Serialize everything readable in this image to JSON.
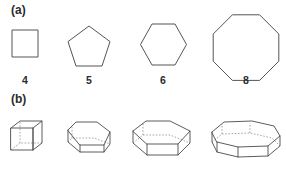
{
  "figure": {
    "background_color": "#ffffff",
    "stroke_color": "#555555",
    "hidden_stroke_color": "#8a8a8a",
    "text_color": "#2b2b2b",
    "panels": [
      {
        "id": "a",
        "label": "(a)",
        "caption_role": "regular-polygons-row"
      },
      {
        "id": "b",
        "label": "(b)",
        "caption_role": "prisms-row"
      }
    ]
  },
  "panel_a": {
    "label": "(a)",
    "shapes": [
      {
        "name": "square",
        "sides": 4,
        "side_count_label": "4",
        "label_x": 25,
        "points": "12,30 38,30 38,57 12,57"
      },
      {
        "name": "pentagon",
        "sides": 5,
        "side_count_label": "5",
        "label_x": 89,
        "points": "89,26 110,41.6 102,66 76,66 68,41.6"
      },
      {
        "name": "hexagon",
        "sides": 6,
        "side_count_label": "6",
        "label_x": 163,
        "points": "152,24 175,24 186.5,44.5 175,65 152,65 140.5,44.5"
      },
      {
        "name": "octagon",
        "sides": 8,
        "side_count_label": "8",
        "label_x": 246,
        "points": "232.4,14.8 259.6,14.8 278.8,34 278.8,61.2 259.6,80.4 232.4,80.4 213.2,61.2 213.2,34"
      }
    ],
    "side_count_labels": [
      "4",
      "5",
      "6",
      "8"
    ],
    "side_count_y": 75
  },
  "panel_b": {
    "label": "(b)",
    "prisms": [
      {
        "name": "cube-prism",
        "base_sides": 4,
        "visible_edges": [
          "M 11,128 L 33,128 L 33,150 L 11,150 Z",
          "M 11,128 L 20,121 L 42,121 L 33,128",
          "M 42,121 L 42,143 L 33,150",
          "M 33,128 L 33,150"
        ],
        "hidden_edges": [
          "M 11,150 L 20,143 L 42,143",
          "M 20,143 L 20,121"
        ]
      },
      {
        "name": "pentagonal-prism",
        "base_sides": 5,
        "visible_edges": [
          "M 68,130 L 76,122 L 97,122 L 110,132 L 104,145 L 80,145 Z",
          "M 68,130 L 68,142 L 80,152 L 104,152 L 110,144 L 110,132",
          "M 80,145 L 80,152",
          "M 104,145 L 104,152"
        ],
        "hidden_edges": [
          "M 68,142 L 72,138 L 94,138 L 110,144",
          "M 72,138 L 72,126"
        ]
      },
      {
        "name": "hexagonal-prism",
        "base_sides": 6,
        "visible_edges": [
          "M 133,131 L 146,121 L 170,121 L 190,131 L 178,144 L 147,144 Z",
          "M 133,131 L 133,143 L 147,155 L 178,155 L 190,143 L 190,131",
          "M 147,144 L 147,155",
          "M 178,144 L 178,155"
        ],
        "hidden_edges": [
          "M 133,143 L 143,135 L 170,135 L 190,143",
          "M 143,135 L 143,123"
        ]
      },
      {
        "name": "octagonal-prism",
        "base_sides": 8,
        "visible_edges": [
          "M 212,132 L 224,122 L 252,121 L 274,126 L 280,136 L 268,146 L 238,147 L 217,142 Z",
          "M 212,132 L 212,142 L 217,152 L 238,157 L 268,156 L 280,146 L 280,136",
          "M 217,142 L 217,152",
          "M 238,147 L 238,157",
          "M 268,146 L 268,156"
        ],
        "hidden_edges": [
          "M 212,142 L 222,134 L 250,133 L 272,138 L 280,146",
          "M 222,134 L 222,124",
          "M 250,133 L 250,123"
        ]
      }
    ]
  }
}
